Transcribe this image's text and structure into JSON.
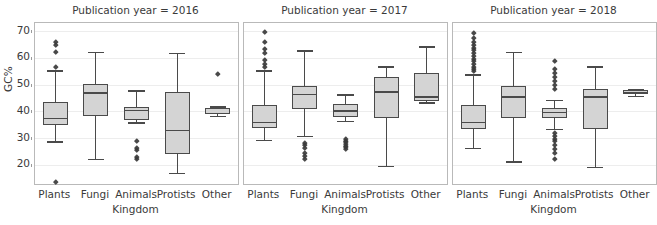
{
  "figure": {
    "ylabel": "GC%",
    "xlabel": "Kingdom",
    "yticks": [
      70,
      60,
      50,
      40,
      30,
      20
    ],
    "ylim": [
      13,
      73
    ],
    "categories": [
      "Plants",
      "Fungi",
      "Animals",
      "Protists",
      "Other"
    ],
    "grid": true,
    "box_fill": "#d4d4d4",
    "box_edge": "#4a4a4a",
    "panel_edge": "#b9b9b9",
    "grid_color": "#ededed"
  },
  "chart_data": {
    "type": "box",
    "xlabel": "Kingdom",
    "ylabel": "GC%",
    "ylim": [
      13,
      73
    ],
    "categories": [
      "Plants",
      "Fungi",
      "Animals",
      "Protists",
      "Other"
    ],
    "grid": true,
    "legend": "none",
    "panels": [
      {
        "title": "Publication year = 2016",
        "boxes": [
          {
            "category": "Plants",
            "whisker_low": 29.0,
            "q1": 35.0,
            "median": 37.5,
            "q3": 43.5,
            "whisker_high": 55.5,
            "outliers": [
              66.0,
              65.0,
              62.5,
              57.0,
              14.0
            ]
          },
          {
            "category": "Fungi",
            "whisker_low": 22.5,
            "q1": 38.5,
            "median": 47.0,
            "q3": 50.5,
            "whisker_high": 62.5,
            "outliers": []
          },
          {
            "category": "Animals",
            "whisker_low": 36.0,
            "q1": 37.0,
            "median": 40.5,
            "q3": 41.8,
            "whisker_high": 48.0,
            "outliers": [
              29.2,
              26.5,
              25.8,
              23.0,
              22.3
            ]
          },
          {
            "category": "Protists",
            "whisker_low": 17.2,
            "q1": 24.2,
            "median": 33.0,
            "q3": 47.5,
            "whisker_high": 62.0,
            "outliers": []
          },
          {
            "category": "Other",
            "whisker_low": 38.5,
            "q1": 39.0,
            "median": 39.3,
            "q3": 41.5,
            "whisker_high": 42.0,
            "outliers": [
              54.2
            ]
          }
        ]
      },
      {
        "title": "Publication year = 2017",
        "boxes": [
          {
            "category": "Plants",
            "whisker_low": 29.5,
            "q1": 34.0,
            "median": 36.0,
            "q3": 42.5,
            "whisker_high": 55.5,
            "outliers": [
              70.0,
              66.0,
              63.5,
              62.0,
              59.5,
              58.0,
              56.8
            ]
          },
          {
            "category": "Fungi",
            "whisker_low": 31.0,
            "q1": 41.0,
            "median": 46.5,
            "q3": 49.5,
            "whisker_high": 63.0,
            "outliers": [
              28.5,
              27.5,
              26.5,
              24.5,
              23.5,
              22.5
            ]
          },
          {
            "category": "Animals",
            "whisker_low": 36.5,
            "q1": 38.0,
            "median": 40.2,
            "q3": 42.8,
            "whisker_high": 46.5,
            "outliers": [
              30.0,
              29.3,
              28.6,
              28.0,
              27.4,
              26.8,
              26.2
            ]
          },
          {
            "category": "Protists",
            "whisker_low": 19.8,
            "q1": 37.5,
            "median": 47.5,
            "q3": 53.0,
            "whisker_high": 57.0,
            "outliers": []
          },
          {
            "category": "Other",
            "whisker_low": 43.5,
            "q1": 44.0,
            "median": 45.5,
            "q3": 54.5,
            "whisker_high": 64.5,
            "outliers": []
          }
        ]
      },
      {
        "title": "Publication year = 2018",
        "boxes": [
          {
            "category": "Plants",
            "whisker_low": 26.5,
            "q1": 33.5,
            "median": 36.0,
            "q3": 42.5,
            "whisker_high": 54.0,
            "outliers": [
              69.5,
              67.5,
              66.0,
              65.0,
              64.0,
              63.0,
              62.0,
              61.0,
              60.0,
              59.0,
              58.0,
              57.0,
              56.2,
              55.5
            ]
          },
          {
            "category": "Fungi",
            "whisker_low": 21.5,
            "q1": 37.5,
            "median": 45.5,
            "q3": 49.5,
            "whisker_high": 62.5,
            "outliers": []
          },
          {
            "category": "Animals",
            "whisker_low": 33.5,
            "q1": 37.5,
            "median": 39.8,
            "q3": 41.5,
            "whisker_high": 44.5,
            "outliers": [
              59.0,
              56.0,
              54.5,
              53.0,
              51.5,
              50.0,
              48.5,
              32.0,
              31.0,
              30.0,
              29.0,
              27.5,
              26.0,
              24.5,
              22.5
            ]
          },
          {
            "category": "Protists",
            "whisker_low": 19.5,
            "q1": 33.5,
            "median": 45.5,
            "q3": 48.5,
            "whisker_high": 57.0,
            "outliers": []
          },
          {
            "category": "Other",
            "whisker_low": 46.0,
            "q1": 46.5,
            "median": 47.2,
            "q3": 48.0,
            "whisker_high": 48.5,
            "outliers": []
          }
        ]
      }
    ]
  }
}
